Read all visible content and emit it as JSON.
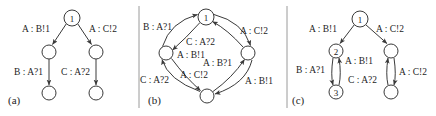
{
  "figure": {
    "width": 436,
    "height": 116,
    "background_color": "#ffffff",
    "stroke_color": "#3a3a3a",
    "text_color": "#1d1d1d"
  },
  "panels": [
    {
      "id": "a",
      "caption": "(a)",
      "caption_x": 8,
      "caption_y": 100,
      "nodes": [
        {
          "id": "a-n1",
          "label": "1",
          "cx": 72,
          "cy": 18,
          "r": 8
        },
        {
          "id": "a-n2",
          "label": "",
          "cx": 49,
          "cy": 52,
          "r": 7
        },
        {
          "id": "a-n3",
          "label": "",
          "cx": 96,
          "cy": 52,
          "r": 7
        },
        {
          "id": "a-n4",
          "label": "",
          "cx": 49,
          "cy": 93,
          "r": 7
        },
        {
          "id": "a-n5",
          "label": "",
          "cx": 96,
          "cy": 93,
          "r": 7
        }
      ],
      "edges": [
        {
          "id": "a-e1",
          "from": "a-n1",
          "to": "a-n2",
          "label": "A : B!1",
          "label_x": 22,
          "label_y": 29
        },
        {
          "id": "a-e2",
          "from": "a-n1",
          "to": "a-n3",
          "label": "A : C!2",
          "label_x": 89,
          "label_y": 29
        },
        {
          "id": "a-e3",
          "from": "a-n2",
          "to": "a-n4",
          "label": "B : A?1",
          "label_x": 14,
          "label_y": 72
        },
        {
          "id": "a-e4",
          "from": "a-n3",
          "to": "a-n5",
          "label": "C : A?2",
          "label_x": 61,
          "label_y": 72
        }
      ]
    },
    {
      "id": "b",
      "caption": "(b)",
      "caption_x": 148,
      "caption_y": 100,
      "nodes": [
        {
          "id": "b-n1",
          "label": "1",
          "cx": 206,
          "cy": 17,
          "r": 8
        },
        {
          "id": "b-n2",
          "label": "",
          "cx": 166,
          "cy": 53,
          "r": 7
        },
        {
          "id": "b-n3",
          "label": "",
          "cx": 248,
          "cy": 53,
          "r": 7
        },
        {
          "id": "b-n4",
          "label": "",
          "cx": 207,
          "cy": 96,
          "r": 7
        }
      ],
      "edges": [
        {
          "id": "b-e1",
          "from": "b-n2",
          "to": "b-n1",
          "label": "B : A?1",
          "label_x": 143,
          "label_y": 27
        },
        {
          "id": "b-e2",
          "from": "b-n1",
          "to": "b-n3",
          "label": "A : C!2",
          "label_x": 240,
          "label_y": 31
        },
        {
          "id": "b-e3",
          "from": "b-n3",
          "to": "b-n1",
          "label": "C : A?2",
          "label_x": 186,
          "label_y": 42
        },
        {
          "id": "b-e4",
          "from": "b-n1",
          "to": "b-n2",
          "label": "A : B!1",
          "label_x": 177,
          "label_y": 55
        },
        {
          "id": "b-e5",
          "from": "b-n4",
          "to": "b-n3",
          "label": "A : B?1",
          "label_x": 203,
          "label_y": 63
        },
        {
          "id": "b-e6",
          "from": "b-n2",
          "to": "b-n4",
          "label": "A : C!2",
          "label_x": 180,
          "label_y": 75
        },
        {
          "id": "b-e7",
          "from": "b-n4",
          "to": "b-n2",
          "label": "C : A?2",
          "label_x": 140,
          "label_y": 80
        },
        {
          "id": "b-e8",
          "from": "b-n3",
          "to": "b-n4",
          "label": "A : B!1",
          "label_x": 245,
          "label_y": 81
        }
      ]
    },
    {
      "id": "c",
      "caption": "(c)",
      "caption_x": 292,
      "caption_y": 100,
      "nodes": [
        {
          "id": "c-n1",
          "label": "1",
          "cx": 360,
          "cy": 19,
          "r": 8
        },
        {
          "id": "c-n2",
          "label": "2",
          "cx": 336,
          "cy": 51,
          "r": 7
        },
        {
          "id": "c-n3",
          "label": "",
          "cx": 391,
          "cy": 51,
          "r": 7
        },
        {
          "id": "c-n4",
          "label": "3",
          "cx": 336,
          "cy": 92,
          "r": 7
        },
        {
          "id": "c-n5",
          "label": "",
          "cx": 391,
          "cy": 92,
          "r": 7
        }
      ],
      "edges": [
        {
          "id": "c-e1",
          "from": "c-n1",
          "to": "c-n2",
          "label": "A : B!1",
          "label_x": 309,
          "label_y": 29
        },
        {
          "id": "c-e2",
          "from": "c-n1",
          "to": "c-n3",
          "label": "A : C!2",
          "label_x": 376,
          "label_y": 29
        },
        {
          "id": "c-e3",
          "from": "c-n2",
          "to": "c-n4",
          "label": "B : A?1",
          "label_x": 296,
          "label_y": 70
        },
        {
          "id": "c-e4",
          "from": "c-n4",
          "to": "c-n2",
          "label": "A : B!1",
          "label_x": 345,
          "label_y": 61
        },
        {
          "id": "c-e5",
          "from": "c-n3",
          "to": "c-n5",
          "label": "A : C!2",
          "label_x": 399,
          "label_y": 72
        },
        {
          "id": "c-e6",
          "from": "c-n5",
          "to": "c-n3",
          "label": "C : A?2",
          "label_x": 348,
          "label_y": 80
        }
      ]
    }
  ],
  "dividers": [
    {
      "id": "divider-1",
      "x": 139,
      "y1": 6,
      "y2": 108
    },
    {
      "id": "divider-2",
      "x": 287,
      "y1": 6,
      "y2": 108
    }
  ]
}
